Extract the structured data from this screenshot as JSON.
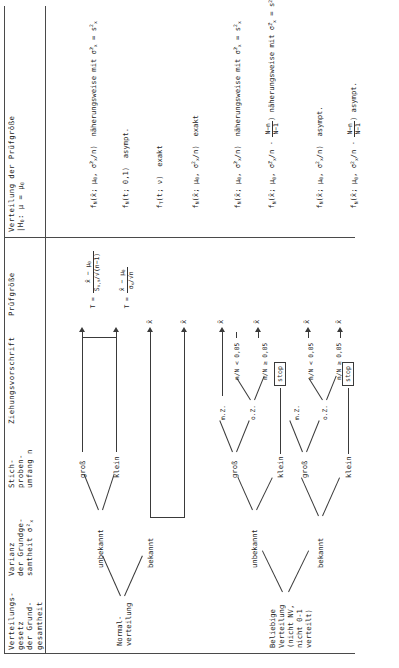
{
  "document": {
    "language": "de",
    "kind": "statistical-decision-table",
    "orientation_note": "table printed rotated 90 degrees on a portrait page",
    "top_marker": "x̄"
  },
  "columns": [
    {
      "id": "verteilungsgesetz",
      "lines": [
        "Verteilungs-",
        "gesetz",
        "der Grund-",
        "gesamtheit"
      ]
    },
    {
      "id": "varianz",
      "lines": [
        "Varianz",
        "der Grundge-",
        "samtheit σ²x"
      ]
    },
    {
      "id": "stichprobenumfang",
      "lines": [
        "Stich-",
        "proben-",
        "umfang n"
      ]
    },
    {
      "id": "ziehungsvorschrift",
      "lines": [
        "Ziehungsvorschrift"
      ]
    },
    {
      "id": "pruefgroesse",
      "lines": [
        "Prüfgröße"
      ]
    },
    {
      "id": "verteilung_pg",
      "lines": [
        "Verteilung der Prüfgröße",
        "|H₀: μ = μ₀"
      ]
    }
  ],
  "distributions": [
    {
      "id": "normal",
      "lines": [
        "Normal-",
        "verteilung"
      ]
    },
    {
      "id": "beliebig",
      "lines": [
        "Beliebige",
        "Verteilung",
        "(nicht NV,",
        "nicht 0-1",
        "verteilt)"
      ]
    }
  ],
  "variance_labels": {
    "bekannt": "bekannt",
    "unbekannt": "unbekannt"
  },
  "sample_size_labels": {
    "gross": "groß",
    "klein": "klein"
  },
  "draw_rules": {
    "mit_zuruecklegen": "m.Z.",
    "ohne_zuruecklegen": "o.Z.",
    "ratio_small": "n/N < 0,05",
    "ratio_large": "n/N ≥ 0,05",
    "stop": "stop"
  },
  "test_statistics": {
    "xbar": "x̄",
    "t_known_sigma": "T = (x̄ − μ₀) / (σx / √n)",
    "t_unknown_sigma": "T = (x̄ − μ₀) / (Sx,n / √(n−1))"
  },
  "rows": [
    {
      "n": 1,
      "distribution": "Normalverteilung",
      "variance": "bekannt",
      "sample_size": "",
      "draw_rule": "",
      "statistic": "x̄",
      "distribution_of_statistic": "f_N(x̄; μ₀, σ²x/n)",
      "qualifier": "näherungsweise mit σ̂²x = s²x"
    },
    {
      "n": 2,
      "distribution": "Normalverteilung",
      "variance": "unbekannt",
      "sample_size": "groß",
      "draw_rule": "",
      "statistic": "T",
      "distribution_of_statistic": "f_N(t; 0,1)",
      "qualifier": "asympt."
    },
    {
      "n": 3,
      "distribution": "Normalverteilung",
      "variance": "unbekannt",
      "sample_size": "klein",
      "draw_rule": "",
      "statistic": "T",
      "distribution_of_statistic": "f_T(t; ν)",
      "qualifier": "exakt"
    },
    {
      "n": 4,
      "distribution": "Normalverteilung",
      "variance": "bekannt",
      "sample_size": "",
      "draw_rule": "",
      "statistic": "x̄",
      "distribution_of_statistic": "f_N(x̄; μ₀, σ²x/n)",
      "qualifier": "exakt"
    },
    {
      "n": 5,
      "distribution": "Beliebige Verteilung",
      "variance": "unbekannt",
      "sample_size": "groß",
      "draw_rule": "m.Z.",
      "statistic": "x̄",
      "distribution_of_statistic": "f_N(x̄; μ₀, σ̂²x/n)",
      "qualifier": "näherungsweise mit σ̂²x = s²x"
    },
    {
      "n": 6,
      "distribution": "Beliebige Verteilung",
      "variance": "unbekannt",
      "sample_size": "groß",
      "draw_rule": "o.Z., n/N ≥ 0,05",
      "statistic": "x̄",
      "distribution_of_statistic": "f_N(x̄; μ₀, σ̂²x/n · (N−n)/(N−1))",
      "qualifier": "näherungsweise mit σ̂²x = s²x"
    },
    {
      "n": 7,
      "distribution": "Beliebige Verteilung",
      "variance": "bekannt",
      "sample_size": "groß",
      "draw_rule": "m.Z.",
      "statistic": "x̄",
      "distribution_of_statistic": "f_N(x̄; μ₀, σ²x/n)",
      "qualifier": "asympt."
    },
    {
      "n": 8,
      "distribution": "Beliebige Verteilung",
      "variance": "bekannt",
      "sample_size": "groß",
      "draw_rule": "o.Z., n/N ≥ 0,05",
      "distribution_of_statistic": "f_N(x̄; μ₀, σ²x/n · (N−n)/(N−1))",
      "statistic": "x̄",
      "qualifier": "asympt."
    },
    {
      "n": 9,
      "distribution": "Beliebige Verteilung",
      "variance": "any",
      "sample_size": "klein",
      "draw_rule": "",
      "statistic": "",
      "distribution_of_statistic": "",
      "qualifier": "stop"
    }
  ]
}
